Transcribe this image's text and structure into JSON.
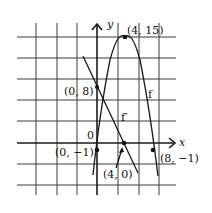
{
  "diagram": {
    "axes": {
      "x_label": "x",
      "y_label": "y",
      "origin_label": "0"
    },
    "curves": [
      {
        "name": "f",
        "label": "f",
        "expression": "f(x) = -x^2 + 8x - 1"
      },
      {
        "name": "f_prime",
        "label": "f′",
        "expression": "f'(x) = -2x + 8"
      }
    ],
    "points": [
      {
        "label": "(4, 15)",
        "x": 4,
        "y": 15,
        "on": "f",
        "note": "maximum of f"
      },
      {
        "label": "(0, 8)",
        "x": 0,
        "y": 8,
        "on": "f_prime"
      },
      {
        "label": "(0, −1)",
        "x": 0,
        "y": -1,
        "on": "f"
      },
      {
        "label": "(4, 0)",
        "x": 4,
        "y": 0,
        "on": "f_prime"
      },
      {
        "label": "(8, −1)",
        "x": 8,
        "y": -1,
        "on": "f"
      }
    ],
    "grid": {
      "units_per_cell_x": 3,
      "units_per_cell_y": 3
    },
    "colors": {
      "ink": "#1a1a1a",
      "grid": "#3a3a3a",
      "background": "#ffffff"
    }
  }
}
